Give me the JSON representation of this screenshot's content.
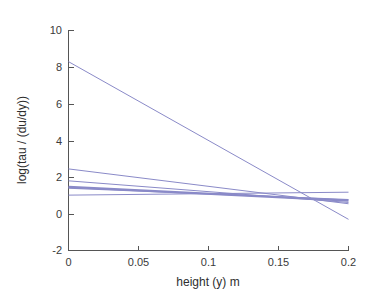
{
  "chart_data": {
    "type": "line",
    "title": "",
    "subtitle": "",
    "xlabel": "height (y) m",
    "ylabel": "log(tau / (du/dy))",
    "xlim": [
      0,
      0.2
    ],
    "ylim": [
      -2,
      10
    ],
    "xticks": [
      0,
      0.05,
      0.1,
      0.15,
      0.2
    ],
    "xticklabels": [
      "0",
      "0.05",
      "0.1",
      "0.15",
      "0.2"
    ],
    "yticks": [
      -2,
      0,
      2,
      4,
      6,
      8,
      10
    ],
    "yticklabels": [
      "-2",
      "0",
      "2",
      "4",
      "6",
      "8",
      "10"
    ],
    "grid": false,
    "legend": null,
    "legend_position": "none",
    "box": false,
    "line_color": "#8a8ac8",
    "line_color_dark": "#7b7bb8",
    "axis_color": "#555555",
    "background": "#ffffff",
    "x": [
      0,
      0.2
    ],
    "series": [
      {
        "name": "steep-profile",
        "color": "#8a8ac8",
        "width": 1.0,
        "values": [
          8.3,
          -0.3
        ]
      },
      {
        "name": "profile-2",
        "color": "#8a8ac8",
        "width": 1.0,
        "values": [
          2.45,
          0.55
        ]
      },
      {
        "name": "profile-3",
        "color": "#8a8ac8",
        "width": 1.0,
        "values": [
          1.8,
          0.62
        ]
      },
      {
        "name": "profile-4",
        "color": "#8a8ac8",
        "width": 2.4,
        "values": [
          1.47,
          0.72
        ]
      },
      {
        "name": "profile-5",
        "color": "#8a8ac8",
        "width": 1.2,
        "values": [
          1.4,
          0.78
        ]
      },
      {
        "name": "profile-6-flat",
        "color": "#8a8ac8",
        "width": 1.0,
        "values": [
          1.02,
          1.18
        ]
      }
    ]
  },
  "axes": {
    "x_tick_0": "0",
    "x_tick_1": "0.05",
    "x_tick_2": "0.1",
    "x_tick_3": "0.15",
    "x_tick_4": "0.2",
    "y_tick_0": "10",
    "y_tick_1": "8",
    "y_tick_2": "6",
    "y_tick_3": "4",
    "y_tick_4": "2",
    "y_tick_5": "0",
    "y_tick_6": "-2",
    "x_label": "height (y) m",
    "y_label": "log(tau / (du/dy))"
  }
}
